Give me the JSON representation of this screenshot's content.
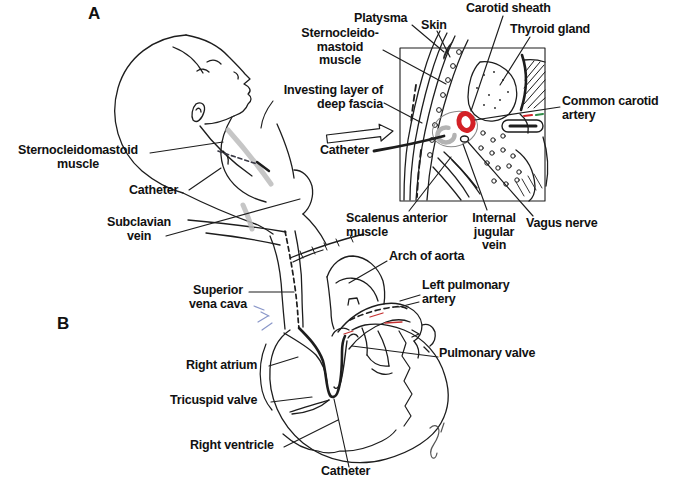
{
  "panel_a": {
    "letter": "A",
    "labels": {
      "sternocleidomastoid_left": "Sternocleidomastoid\nmuscle",
      "catheter_neck": "Catheter",
      "subclavian_vein": "Subclavian\nvein",
      "platysma": "Platysma",
      "skin": "Skin",
      "carotid_sheath": "Carotid sheath",
      "thyroid_gland": "Thyroid gland",
      "sternocleidomastoid_right": "Sternocleido-\nmastoid\nmuscle",
      "investing_fascia": "Investing layer of\ndeep fascia",
      "common_carotid_artery": "Common carotid\nartery",
      "catheter_inset": "Catheter",
      "scalenus_anterior": "Scalenus anterior\nmuscle",
      "internal_jugular_vein": "Internal\njugular\nvein",
      "vagus_nerve": "Vagus nerve"
    }
  },
  "panel_b": {
    "letter": "B",
    "labels": {
      "arch_of_aorta": "Arch of aorta",
      "superior_vena_cava": "Superior\nvena cava",
      "left_pulmonary_artery": "Left pulmonary\nartery",
      "right_atrium": "Right atrium",
      "pulmonary_valve": "Pulmonary valve",
      "tricuspid_valve": "Tricuspid valve",
      "right_ventricle": "Right ventricle",
      "catheter_heart": "Catheter"
    }
  },
  "colors": {
    "line": "#1d1d1d",
    "artery_highlight_red": "#d32127",
    "catheter_gray": "#bcbcbc",
    "vein_gray": "#b3b3b3",
    "annotation_blue": "#8a97c9",
    "annotation_green": "#2e8b46"
  }
}
